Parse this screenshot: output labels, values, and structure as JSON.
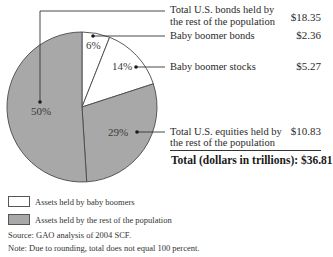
{
  "chart_data": {
    "type": "pie",
    "title": "",
    "units": "dollars in trillions",
    "start_angle": "12 o'clock, clockwise",
    "slices": [
      {
        "label": "Baby boomer bonds",
        "percent": 6,
        "value": 2.36,
        "group": "Assets held by baby boomers",
        "color": "#ffffff"
      },
      {
        "label": "Baby boomer stocks",
        "percent": 14,
        "value": 5.27,
        "group": "Assets held by baby boomers",
        "color": "#ffffff"
      },
      {
        "label": "Total U.S. equities held by the rest of the population",
        "percent": 29,
        "value": 10.83,
        "group": "Assets held by the rest of the population",
        "color": "#a8a8a8"
      },
      {
        "label": "Total U.S. bonds held by the rest of the population",
        "percent": 50,
        "value": 18.35,
        "group": "Assets held by the rest of the population",
        "color": "#a8a8a8"
      }
    ],
    "total": 36.81,
    "legend": [
      {
        "label": "Assets held by baby boomers",
        "color": "#ffffff"
      },
      {
        "label": "Assets held by the rest of the population",
        "color": "#a8a8a8"
      }
    ],
    "legend_position": "bottom-left"
  },
  "labels": {
    "rest_bonds_line1": "Total U.S. bonds held by",
    "rest_bonds_line2": "the rest of the population",
    "rest_bonds_value": "$18.35",
    "boomer_bonds": "Baby boomer bonds",
    "boomer_bonds_value": "$2.36",
    "boomer_stocks": "Baby boomer stocks",
    "boomer_stocks_value": "$5.27",
    "rest_equities_line1": "Total U.S. equities held by",
    "rest_equities_line2": "the rest of the population",
    "rest_equities_value": "$10.83",
    "total": "Total (dollars in trillions): $36.81"
  },
  "percent_labels": {
    "boomer_bonds": "6%",
    "boomer_stocks": "14%",
    "rest_equities": "29%",
    "rest_bonds": "50%"
  },
  "legend": {
    "boomers": "Assets held by baby boomers",
    "rest": "Assets held by the rest of the population"
  },
  "footer": {
    "source": "Source: GAO analysis of 2004 SCF.",
    "note": "Note: Due to rounding, total does not equal 100 percent."
  },
  "colors": {
    "gray_slice": "#a8a8a8",
    "white_slice": "#ffffff",
    "outline": "#4a4a4a"
  }
}
